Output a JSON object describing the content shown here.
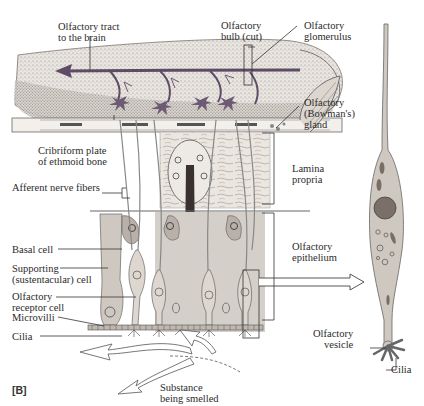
{
  "figure": {
    "panel_label": "[B]",
    "colors": {
      "background": "#ffffff",
      "bulb_fill": "#e8e3de",
      "stipple": "#8a8580",
      "epithelium_fill": "#cfc9c3",
      "cell_fill": "#c9c2bb",
      "accent_purple": "#6d5a74",
      "line": "#333333"
    }
  },
  "labels": {
    "olfactory_tract": [
      "Olfactory tract",
      "to the brain"
    ],
    "olfactory_bulb": [
      "Olfactory",
      "bulb (cut)"
    ],
    "olfactory_glomerulus": [
      "Olfactory",
      "glomerulus"
    ],
    "bowmans_gland": [
      "Olfactory",
      "(Bowman's)",
      "gland"
    ],
    "cribriform_plate": [
      "Cribriform plate",
      "of ethmoid bone"
    ],
    "afferent_nerve_fibers": [
      "Afferent nerve fibers"
    ],
    "lamina_propria": [
      "Lamina",
      "propria"
    ],
    "basal_cell": [
      "Basal cell"
    ],
    "supporting_cell": [
      "Supporting",
      "(sustentacular) cell"
    ],
    "olfactory_epithelium": [
      "Olfactory",
      "epithelium"
    ],
    "olfactory_receptor_cell": [
      "Olfactory",
      "receptor cell"
    ],
    "microvilli": [
      "Microvilli"
    ],
    "cilia_left": [
      "Cilia"
    ],
    "olfactory_vesicle": [
      "Olfactory",
      "vesicle"
    ],
    "cilia_right": [
      "Cilia"
    ],
    "substance": [
      "Substance",
      "being smelled"
    ]
  }
}
